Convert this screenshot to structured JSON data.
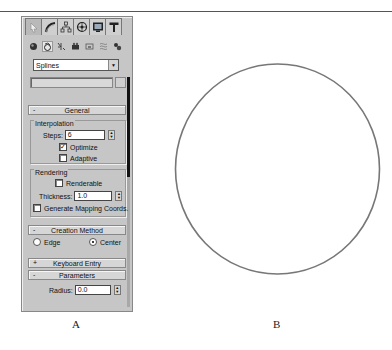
{
  "figure": {
    "caption_a": "A",
    "caption_b": "B"
  },
  "command_panel": {
    "tabs": [
      {
        "id": "create",
        "icon": "create-pointer-icon",
        "active": true
      },
      {
        "id": "modify",
        "icon": "modify-curve-icon"
      },
      {
        "id": "hierarchy",
        "icon": "hierarchy-icon"
      },
      {
        "id": "motion",
        "icon": "motion-wheel-icon"
      },
      {
        "id": "display",
        "icon": "display-monitor-icon"
      },
      {
        "id": "utilities",
        "icon": "utilities-hammer-icon"
      }
    ],
    "category_icons": [
      {
        "id": "geometry",
        "icon": "sphere-icon"
      },
      {
        "id": "shapes",
        "icon": "shapes-icon",
        "active": true
      },
      {
        "id": "lights",
        "icon": "lights-icon"
      },
      {
        "id": "cameras",
        "icon": "camera-icon"
      },
      {
        "id": "helpers",
        "icon": "helpers-icon"
      },
      {
        "id": "spacewarps",
        "icon": "spacewarp-icon"
      },
      {
        "id": "systems",
        "icon": "systems-icon"
      }
    ],
    "dropdown": {
      "selected": "Splines"
    },
    "name_field": {
      "value": ""
    },
    "rollouts": {
      "general": {
        "sign": "-",
        "title": "General",
        "interpolation": {
          "title": "Interpolation",
          "steps_label": "Steps:",
          "steps_value": "6",
          "optimize_label": "Optimize",
          "optimize_checked": true,
          "adaptive_label": "Adaptive",
          "adaptive_checked": false
        },
        "rendering": {
          "title": "Rendering",
          "renderable_label": "Renderable",
          "renderable_checked": false,
          "thickness_label": "Thickness:",
          "thickness_value": "1.0",
          "mapping_label": "Generate Mapping Coords.",
          "mapping_checked": false
        }
      },
      "creation_method": {
        "sign": "-",
        "title": "Creation Method",
        "edge_label": "Edge",
        "edge_checked": false,
        "center_label": "Center",
        "center_checked": true
      },
      "keyboard_entry": {
        "sign": "+",
        "title": "Keyboard Entry"
      },
      "parameters": {
        "sign": "-",
        "title": "Parameters",
        "radius_label": "Radius:",
        "radius_value": "0.0"
      }
    }
  },
  "viewport": {
    "shape": "circle",
    "stroke_color": "#777777"
  }
}
